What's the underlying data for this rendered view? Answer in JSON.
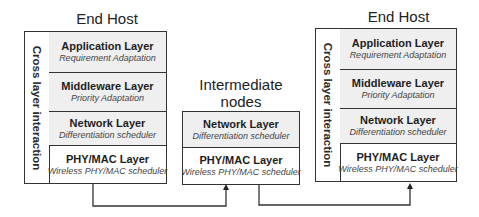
{
  "left_host": {
    "title": "End Host",
    "side_label": "Cross layer interaction",
    "layers": [
      {
        "name": "Application Layer",
        "sub": "Requirement Adaptation"
      },
      {
        "name": "Middleware Layer",
        "sub": "Priority Adaptation"
      },
      {
        "name": "Network Layer",
        "sub": "Differentiation scheduler"
      },
      {
        "name": "PHY/MAC Layer",
        "sub": "Wireless PHY/MAC scheduler"
      }
    ]
  },
  "intermediate": {
    "title_line1": "Intermediate",
    "title_line2": "nodes",
    "layers": [
      {
        "name": "Network Layer",
        "sub": "Differentiation scheduler"
      },
      {
        "name": "PHY/MAC Layer",
        "sub": "Wireless PHY/MAC scheduler"
      }
    ]
  },
  "right_host": {
    "title": "End Host",
    "side_label": "Cross layer interaction",
    "layers": [
      {
        "name": "Application Layer",
        "sub": "Requirement Adaptation"
      },
      {
        "name": "Middleware Layer",
        "sub": "Priority Adaptation"
      },
      {
        "name": "Network Layer",
        "sub": "Differentiation scheduler"
      },
      {
        "name": "PHY/MAC Layer",
        "sub": "Wireless PHY/MAC scheduler"
      }
    ]
  },
  "colors": {
    "line": "#333333",
    "shade": "#efefef"
  }
}
